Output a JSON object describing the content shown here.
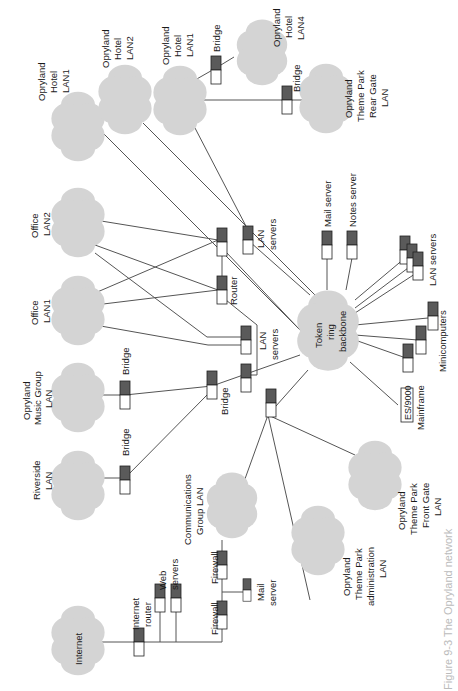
{
  "diagram": {
    "orientation": "rotated-90-ccw",
    "colors": {
      "cloud": "#d4d4d4",
      "device_top": "#5a5a5a",
      "device_bottom": "#ffffff",
      "link": "#555555"
    },
    "hub": {
      "label_lines": [
        "Token",
        "ring",
        "backbone"
      ]
    },
    "clouds": {
      "internet": {
        "label_lines": [
          "Internet"
        ]
      },
      "riverside": {
        "label_lines": [
          "Riverside",
          "LAN"
        ]
      },
      "music": {
        "label_lines": [
          "Opryland",
          "Music Group",
          "LAN"
        ]
      },
      "office1": {
        "label_lines": [
          "Office",
          "LAN1"
        ]
      },
      "office2": {
        "label_lines": [
          "Office",
          "LAN2"
        ]
      },
      "hotel1a": {
        "label_lines": [
          "Opryland",
          "Hotel",
          "LAN1"
        ]
      },
      "hotel2": {
        "label_lines": [
          "Opryland",
          "Hotel",
          "LAN2"
        ]
      },
      "hotel1b": {
        "label_lines": [
          "Opryland",
          "Hotel",
          "LAN1"
        ]
      },
      "hotel4": {
        "label_lines": [
          "Opryland",
          "Hotel",
          "LAN4"
        ]
      },
      "rear_gate": {
        "label_lines": [
          "Opryland",
          "Theme Park",
          "Rear Gate",
          "LAN"
        ]
      },
      "comms": {
        "label_lines": [
          "Communications",
          "Group LAN"
        ]
      },
      "admin": {
        "label_lines": [
          "Opryland",
          "Theme Park",
          "administration",
          "LAN"
        ]
      },
      "front_gate": {
        "label_lines": [
          "Opryland",
          "Theme Park",
          "Front Gate",
          "LAN"
        ]
      }
    },
    "devices": {
      "internet_router": {
        "label_lines": [
          "Internet",
          "router"
        ]
      },
      "web_servers": {
        "label_lines": [
          "Web",
          "servers"
        ]
      },
      "firewall1": {
        "label": "Firewall"
      },
      "firewall2": {
        "label": "Firewall"
      },
      "mail_server_fw": {
        "label_lines": [
          "Mail",
          "server"
        ]
      },
      "bridge_riverside": {
        "label": "Bridge"
      },
      "bridge_music": {
        "label": "Bridge"
      },
      "bridge_main": {
        "label": "Bridge"
      },
      "router": {
        "label": "Router"
      },
      "lan_servers_mid": {
        "label_lines": [
          "LAN",
          "servers"
        ]
      },
      "lan_servers_top": {
        "label_lines": [
          "LAN",
          "servers"
        ]
      },
      "bridge_hotel": {
        "label": "Bridge"
      },
      "bridge_rear": {
        "label": "Bridge"
      },
      "mail_server": {
        "label": "Mail server"
      },
      "notes_server": {
        "label": "Notes server"
      },
      "lan_servers_right": {
        "label": "LAN servers"
      },
      "minicomputers": {
        "label": "Minicomputers"
      },
      "mainframe": {
        "box_label": "ES/9000",
        "label": "Mainframe"
      }
    },
    "caption": "Figure 9-3 The Opryland network"
  }
}
